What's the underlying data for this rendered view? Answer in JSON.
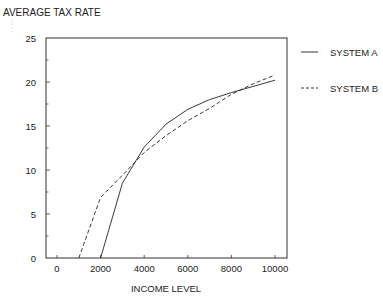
{
  "chart_data": {
    "type": "line",
    "title": "AVERAGE TAX RATE",
    "xlabel": "INCOME LEVEL",
    "ylabel": "AVERAGE TAX RATE",
    "xlim": [
      -500,
      10300
    ],
    "ylim": [
      0,
      25
    ],
    "x_ticks": [
      0,
      2000,
      4000,
      6000,
      8000,
      10000
    ],
    "x_tick_labels": [
      "0",
      "2000",
      "4000",
      "6000",
      "8000",
      "10000"
    ],
    "y_ticks": [
      0,
      5,
      10,
      15,
      20,
      25
    ],
    "y_tick_labels": [
      "0",
      "5",
      "10",
      "15",
      "20",
      "25"
    ],
    "y_minor_ticks": [
      2.5,
      7.5,
      12.5,
      17.5,
      22.5
    ],
    "grid": false,
    "legend_position": "right",
    "series": [
      {
        "name": "SYSTEM A",
        "style": "solid",
        "x": [
          2000,
          3000,
          4000,
          5000,
          6000,
          7000,
          8000,
          9000,
          10000
        ],
        "y": [
          0,
          8.5,
          12.6,
          15.2,
          16.9,
          18.0,
          18.8,
          19.5,
          20.2
        ]
      },
      {
        "name": "SYSTEM B",
        "style": "dashed",
        "x": [
          1000,
          2000,
          3000,
          4000,
          5000,
          6000,
          7000,
          8000,
          9000,
          10000
        ],
        "y": [
          0,
          6.9,
          9.4,
          12.0,
          13.9,
          15.6,
          17.0,
          18.6,
          19.8,
          20.8
        ]
      }
    ]
  },
  "legend": {
    "items": [
      {
        "label": "SYSTEM A",
        "style": "solid"
      },
      {
        "label": "SYSTEM B",
        "style": "dashed"
      }
    ]
  },
  "colors": {
    "line": "#222222",
    "axis": "#333333",
    "background": "#ffffff"
  }
}
